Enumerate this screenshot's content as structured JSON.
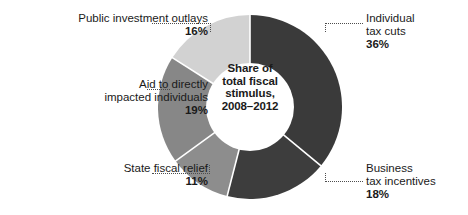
{
  "chart_data": {
    "type": "pie",
    "title": "Share of total fiscal stimulus, 2008–2012",
    "center_label_lines": [
      "Share of",
      "total fiscal",
      "stimulus,",
      "2008–2012"
    ],
    "xlabel": "",
    "ylabel": "",
    "legend_position": "callouts",
    "grid": false,
    "donut": true,
    "inner_radius_ratio": 0.48,
    "start_angle_deg": 0,
    "direction": "clockwise",
    "units": "percent",
    "total": 100,
    "categories": [
      "Individual tax cuts",
      "Business tax incentives",
      "State fiscal relief",
      "Aid to directly impacted individuals",
      "Public investment outlays"
    ],
    "values": [
      36,
      18,
      11,
      19,
      16
    ],
    "slices": [
      {
        "label": "Individual tax cuts",
        "label_lines": [
          "Individual",
          "tax cuts"
        ],
        "value": 36,
        "value_text": "36%",
        "color": "#3a3a3a",
        "start_deg": 0,
        "end_deg": 129.6
      },
      {
        "label": "Business tax incentives",
        "label_lines": [
          "Business",
          "tax incentives"
        ],
        "value": 18,
        "value_text": "18%",
        "color": "#3d3d3d",
        "start_deg": 129.6,
        "end_deg": 194.4
      },
      {
        "label": "State fiscal relief",
        "label_lines": [
          "State fiscal relief"
        ],
        "value": 11,
        "value_text": "11%",
        "color": "#8d8d8d",
        "start_deg": 194.4,
        "end_deg": 234.0
      },
      {
        "label": "Aid to directly impacted individuals",
        "label_lines": [
          "Aid to directly",
          "impacted individuals"
        ],
        "value": 19,
        "value_text": "19%",
        "color": "#878787",
        "start_deg": 234.0,
        "end_deg": 302.4
      },
      {
        "label": "Public investment outlays",
        "label_lines": [
          "Public investment outlays"
        ],
        "value": 16,
        "value_text": "16%",
        "color": "#d2d2d2",
        "start_deg": 302.4,
        "end_deg": 360.0
      }
    ],
    "colors": {
      "dark_gray": "#3a3a3a",
      "medium_gray": "#8a8a8a",
      "light_gray": "#d2d2d2",
      "separator": "#ffffff",
      "text": "#1a1a1a",
      "leader_line": "#4d4d4d",
      "background": "#ffffff"
    }
  },
  "callouts": {
    "public_investment": {
      "name": "Public investment outlays",
      "value": "16%"
    },
    "aid_individuals": {
      "line1": "Aid to directly",
      "line2": "impacted individuals",
      "value": "19%"
    },
    "state_relief": {
      "name": "State fiscal relief",
      "value": "11%"
    },
    "individual_tax_cuts": {
      "line1": "Individual",
      "line2": "tax cuts",
      "value": "36%"
    },
    "business_incentives": {
      "line1": "Business",
      "line2": "tax incentives",
      "value": "18%"
    }
  },
  "center": {
    "line1": "Share of",
    "line2": "total fiscal",
    "line3": "stimulus,",
    "line4": "2008–2012"
  }
}
